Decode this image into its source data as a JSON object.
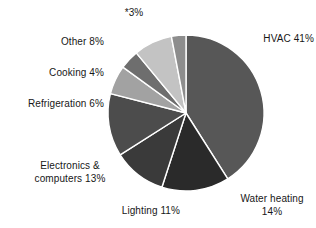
{
  "chart_data": {
    "type": "pie",
    "title": "",
    "subtitle": "",
    "xlabel": "",
    "ylabel": "",
    "legend_position": "none",
    "grid": false,
    "units": "percent",
    "start_angle_deg": 0,
    "direction": "clockwise",
    "categories": [
      "HVAC",
      "Water heating",
      "Lighting",
      "Electronics & computers",
      "Refrigeration",
      "Cooking",
      "Other",
      "*"
    ],
    "values": [
      41,
      14,
      11,
      13,
      6,
      4,
      8,
      3
    ],
    "labels": [
      "HVAC 41%",
      "Water heating\n14%",
      "Lighting 11%",
      "Electronics &\ncomputers 13%",
      "Refrigeration 6%",
      "Cooking 4%",
      "Other 8%",
      "*3%"
    ],
    "slice_colors": [
      "#575757",
      "#2a2a2a",
      "#3a3a3a",
      "#4c4c4c",
      "#a2a2a2",
      "#6e6e6e",
      "#c3c3c3",
      "#8d8d8d"
    ],
    "slice_border_color": "#ffffff",
    "background_color": "#ffffff",
    "text_color": "#171717"
  },
  "labels": {
    "hvac": "HVAC 41%",
    "water_heating": "Water heating\n14%",
    "lighting": "Lighting 11%",
    "electronics": "Electronics &\ncomputers 13%",
    "refrigeration": "Refrigeration 6%",
    "cooking": "Cooking 4%",
    "other": "Other 8%",
    "star3": "*3%"
  }
}
